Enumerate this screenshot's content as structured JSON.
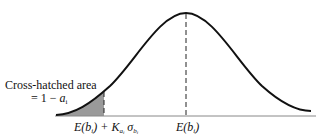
{
  "diagram": {
    "type": "normal-distribution",
    "shaded_area_label_line1": "Cross-hatched area",
    "shaded_area_label_line2_prefix": "= 1 − ",
    "shaded_area_label_line2_var": "a",
    "shaded_area_label_line2_sub": "i",
    "x_labels": {
      "threshold": {
        "E": "E(b",
        "sub1": "i",
        "close": ") + K",
        "sub_a": "a",
        "sub_a_i": "i",
        "sigma": " σ",
        "sub_b": "b",
        "sub_b_i": "i"
      },
      "mean": {
        "E": "E(b",
        "sub1": "i",
        "close": ")"
      }
    },
    "colors": {
      "curve": "#111111",
      "shade": "#9a9a9a",
      "baseline": "#888888"
    }
  }
}
